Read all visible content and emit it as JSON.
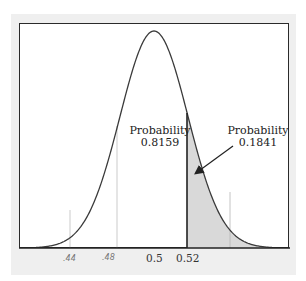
{
  "chart_data": {
    "type": "area",
    "title": "",
    "xlabel": "",
    "ylabel": "",
    "distribution": "normal",
    "mean": 0.5,
    "cutoff": 0.52,
    "x_ticks": [
      "0.5",
      "0.52"
    ],
    "handwritten_ticks": [
      ".44",
      ".48"
    ],
    "regions": [
      {
        "name": "left",
        "label": "Probability",
        "value": "0.8159",
        "shaded": false
      },
      {
        "name": "right",
        "label": "Probability",
        "value": "0.1841",
        "shaded": true
      }
    ],
    "grid": false,
    "legend": "none"
  },
  "labels": {
    "left_title": "Probability",
    "left_value": "0.8159",
    "right_title": "Probability",
    "right_value": "0.1841",
    "tick_mean": "0.5",
    "tick_cutoff": "0.52",
    "hand_tick_1": ".44",
    "hand_tick_2": ".48"
  },
  "colors": {
    "curve": "#3a3a3a",
    "shade": "#d9d9d9",
    "frame": "#efefef",
    "axis": "#2a2a2a"
  }
}
